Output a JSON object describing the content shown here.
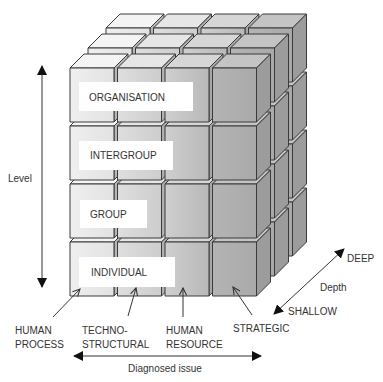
{
  "diagram": {
    "axes": {
      "level": {
        "label": "Level"
      },
      "diagnosed_issue": {
        "label": "Diagnosed issue"
      },
      "depth": {
        "label": "Depth",
        "high": "DEEP",
        "low": "SHALLOW"
      }
    },
    "levels": [
      {
        "label": "ORGANISATION"
      },
      {
        "label": "INTERGROUP"
      },
      {
        "label": "GROUP"
      },
      {
        "label": "INDIVIDUAL"
      }
    ],
    "issues": [
      {
        "line1": "HUMAN",
        "line2": "PROCESS"
      },
      {
        "line1": "TECHNO-",
        "line2": "STRUCTURAL"
      },
      {
        "line1": "HUMAN",
        "line2": "RESOURCE"
      },
      {
        "line1": "STRATEGIC",
        "line2": ""
      }
    ],
    "grid": {
      "columns": 4,
      "rows": 4,
      "depth_layers": 3
    },
    "colors": {
      "stroke": "#3a3a3a",
      "text": "#333333",
      "label_box": "#ffffff",
      "columns": [
        {
          "front_from": "#efefef",
          "front_to": "#e2e2e2",
          "top": "#f4f4f4",
          "side": "#b8b8b8"
        },
        {
          "front_from": "#dedede",
          "front_to": "#cdcdcd",
          "top": "#e6e6e6",
          "side": "#b0b0b0"
        },
        {
          "front_from": "#cfcfcf",
          "front_to": "#b8b8b8",
          "top": "#d6d6d6",
          "side": "#a8a8a8"
        },
        {
          "front_from": "#b4b4b4",
          "front_to": "#a9a9a9",
          "top": "#c4c4c4",
          "side": "#9c9c9c"
        }
      ]
    }
  }
}
